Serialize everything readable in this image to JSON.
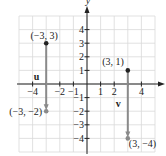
{
  "axes": {
    "x_label": "x",
    "y_label": "y",
    "x_ticks": [
      {
        "value": -4,
        "label": "−4"
      },
      {
        "value": -3,
        "label": ""
      },
      {
        "value": -2,
        "label": "−2"
      },
      {
        "value": -1,
        "label": "−1"
      },
      {
        "value": 1,
        "label": "1"
      },
      {
        "value": 2,
        "label": "2"
      },
      {
        "value": 3,
        "label": ""
      },
      {
        "value": 4,
        "label": "4"
      }
    ],
    "y_ticks": [
      {
        "value": 4,
        "label": "4"
      },
      {
        "value": 3,
        "label": "3"
      },
      {
        "value": 2,
        "label": "2"
      },
      {
        "value": 1,
        "label": "1"
      },
      {
        "value": -1,
        "label": "−1"
      },
      {
        "value": -2,
        "label": "−2"
      },
      {
        "value": -3,
        "label": "−3"
      },
      {
        "value": -4,
        "label": "−4"
      }
    ],
    "range": {
      "x": [
        -5,
        5
      ],
      "y": [
        -5,
        5
      ]
    },
    "grid": true
  },
  "vectors": [
    {
      "name": "u",
      "tail": [
        -3,
        3
      ],
      "head": [
        -3,
        -2
      ],
      "tail_label": "(−3, 3)",
      "head_label": "(−3, −2)"
    },
    {
      "name": "v",
      "tail": [
        3,
        1
      ],
      "head": [
        3,
        -4
      ],
      "tail_label": "(3, 1)",
      "head_label": "(3, −4)"
    }
  ],
  "colors": {
    "grid": "#d9d9d9",
    "axis": "#222222",
    "vector": "#8a8a8a",
    "point": "#222222"
  }
}
